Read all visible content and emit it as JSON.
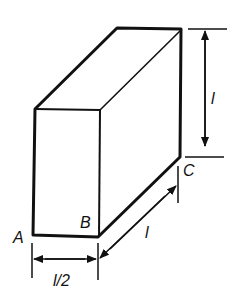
{
  "diagram": {
    "colors": {
      "stroke": "#111111",
      "background": "#ffffff"
    },
    "labels": {
      "A": "A",
      "B": "B",
      "C": "C",
      "height": "l",
      "depth": "l",
      "width": "l/2"
    }
  }
}
